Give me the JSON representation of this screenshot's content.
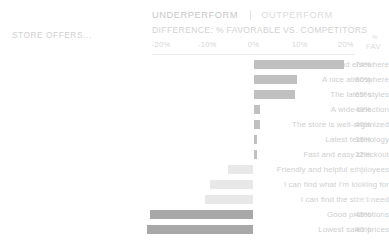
{
  "header": {
    "underperform_label": "UNDERPERFORM",
    "outperform_label": "OUTPERFORM",
    "difference_label": "DIFFERENCE: % FAVORABLE VS. COMPETITORS",
    "category_title": "STORE OFFERS...",
    "fav_pct_symbol": "%",
    "fav_label": "FAV"
  },
  "colors": {
    "bar_positive": "#c0c0c0",
    "bar_negative_light": "#e8e8e8",
    "bar_negative_dark": "#a8a8a8",
    "axis_rule": "#ededed",
    "text_muted": "#cfcfcf",
    "text_faint": "#efefef"
  },
  "chart_data": {
    "type": "bar",
    "title": "DIFFERENCE: % FAVORABLE VS. COMPETITORS",
    "subtitle": "STORE OFFERS...",
    "orientation": "horizontal",
    "diverging": true,
    "xlabel": "",
    "ylabel": "",
    "xlim": [
      -25,
      25
    ],
    "grid": false,
    "legend": [
      "UNDERPERFORM",
      "OUTPERFORM"
    ],
    "xticks": [
      -20,
      -10,
      0,
      10,
      20
    ],
    "xticklabels": [
      "-20%",
      "-10%",
      "0%",
      "10%",
      "20%"
    ],
    "value_column_header": "% FAV",
    "categories": [
      "Items I can't find elsewhere",
      "A nice atmosphere",
      "The latest styles",
      "A wide selection",
      "The store is well-organized",
      "Latest technology",
      "Fast and easy checkout",
      "Friendly and helpful employees",
      "I can find what I'm looking for",
      "I can find the size I need",
      "Good promotions",
      "Lowest sales prices"
    ],
    "values": [
      19.5,
      9.5,
      9.0,
      1.5,
      1.5,
      0.7,
      0.7,
      -5.5,
      -9.5,
      -10.5,
      -22.5,
      -23.0
    ],
    "favorable": [
      "74%",
      "80%",
      "65%",
      "49%",
      "40%",
      "36%",
      "32%",
      "30%",
      "28%",
      "26%",
      "45%",
      "40%"
    ]
  },
  "rows": [
    {
      "label": "Items I can't find elsewhere",
      "value": 19.5,
      "fav": "74%",
      "tone": "pos",
      "fav_tone": "normal"
    },
    {
      "label": "A nice atmosphere",
      "value": 9.5,
      "fav": "80%",
      "tone": "pos",
      "fav_tone": "normal"
    },
    {
      "label": "The latest styles",
      "value": 9.0,
      "fav": "65%",
      "tone": "pos",
      "fav_tone": "normal"
    },
    {
      "label": "A wide selection",
      "value": 1.5,
      "fav": "49%",
      "tone": "pos",
      "fav_tone": "normal"
    },
    {
      "label": "The store is well-organized",
      "value": 1.5,
      "fav": "40%",
      "tone": "pos",
      "fav_tone": "normal"
    },
    {
      "label": "Latest technology",
      "value": 0.7,
      "fav": "36%",
      "tone": "pos",
      "fav_tone": "normal"
    },
    {
      "label": "Fast and easy checkout",
      "value": 0.7,
      "fav": "32%",
      "tone": "pos",
      "fav_tone": "normal"
    },
    {
      "label": "Friendly and helpful employees",
      "value": -5.5,
      "fav": "30%",
      "tone": "neg-light",
      "fav_tone": "faint"
    },
    {
      "label": "I can find what I'm looking for",
      "value": -9.5,
      "fav": "28%",
      "tone": "neg-light",
      "fav_tone": "faint"
    },
    {
      "label": "I can find the size I need",
      "value": -10.5,
      "fav": "26%",
      "tone": "neg-light",
      "fav_tone": "faint"
    },
    {
      "label": "Good promotions",
      "value": -22.5,
      "fav": "45%",
      "tone": "neg-dark",
      "fav_tone": "normal"
    },
    {
      "label": "Lowest sales prices",
      "value": -23.0,
      "fav": "40%",
      "tone": "neg-dark",
      "fav_tone": "normal"
    }
  ]
}
